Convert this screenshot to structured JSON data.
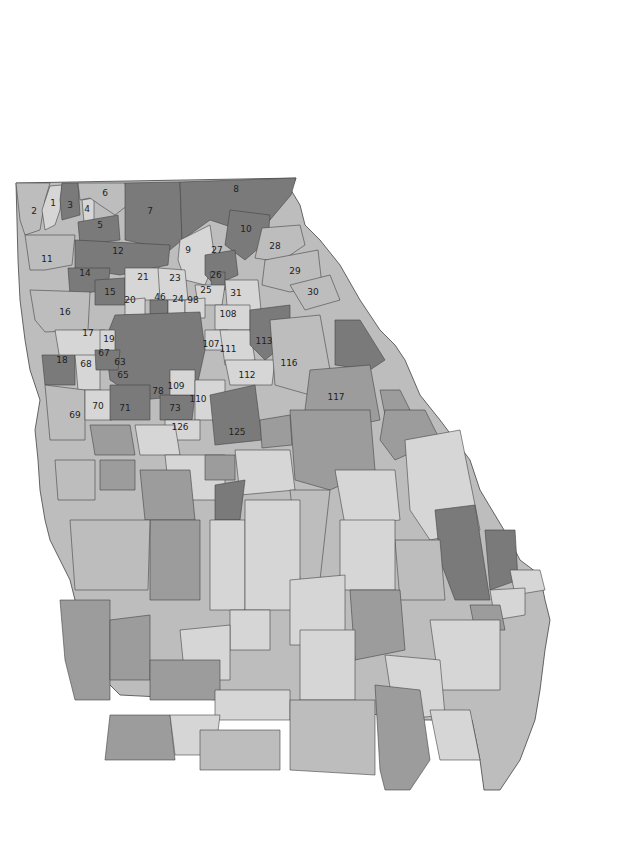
{
  "map": {
    "title": "Georgia State House Districts - Population Growth",
    "colors": {
      "c1": "#9c9c9c",
      "c2": "#bdbdbd",
      "c3": "#7a7a7a",
      "c4": "#d6d6d6",
      "border": "#444444",
      "water": "#ffffff"
    },
    "cities": [
      {
        "name": "Rome"
      },
      {
        "name": "Marietta"
      },
      {
        "name": "Atlanta"
      },
      {
        "name": "Athens"
      },
      {
        "name": "Augusta"
      },
      {
        "name": "Macon"
      },
      {
        "name": "Warner Robins"
      },
      {
        "name": "Columbus"
      },
      {
        "name": "Albany"
      },
      {
        "name": "Savannah"
      }
    ],
    "callouts": [
      "13",
      "114",
      "115",
      "118",
      "119",
      "120",
      "121",
      "137",
      "138",
      "139",
      "131",
      "133",
      "132",
      "145",
      "146",
      "151",
      "175",
      "179"
    ],
    "scale_bar": {
      "ticks": [
        "0",
        "35",
        "70"
      ],
      "unit": "Miles"
    }
  },
  "inset": {
    "districts": [
      "159",
      "160",
      "161",
      "162",
      "163",
      "164"
    ],
    "scale_bar": {
      "ticks": [
        "0",
        "5",
        "10"
      ],
      "unit": "Miles"
    }
  },
  "legend": {
    "title": "Population Growth",
    "items": [
      {
        "label": "-6% to 4%",
        "color": "#9c9c9c"
      },
      {
        "label": "4% to 13%",
        "color": "#bdbdbd"
      },
      {
        "label": "13% to 27%",
        "color": "#7a7a7a"
      },
      {
        "label": "27% to 52%",
        "color": "#d6d6d6"
      }
    ]
  }
}
